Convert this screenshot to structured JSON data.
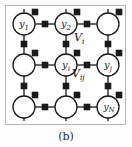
{
  "figure": {
    "caption": "(b)",
    "frame": {
      "color": "#b9b7b5"
    },
    "colors": {
      "stroke": "#1a1a1a",
      "factor_fill": "#1a1a1a",
      "node_fill": "#ffffff",
      "background": "#ffffff"
    },
    "diagram_type": "factor-graph-grid",
    "grid": {
      "columns": 3,
      "rows": 3,
      "node_centers_x": [
        24,
        66,
        108
      ],
      "node_centers_y": [
        24,
        65,
        107
      ],
      "node_radius": 11,
      "factor_square_size": 5
    },
    "nodes": [
      {
        "id": "n00",
        "label": "y",
        "sub": "1",
        "has_label": true,
        "cx": 24,
        "cy": 24
      },
      {
        "id": "n01",
        "label": "y",
        "sub": "2",
        "has_label": true,
        "cx": 66,
        "cy": 24
      },
      {
        "id": "n02",
        "label": "",
        "sub": "",
        "has_label": false,
        "cx": 108,
        "cy": 24
      },
      {
        "id": "n10",
        "label": "",
        "sub": "",
        "has_label": false,
        "cx": 24,
        "cy": 65
      },
      {
        "id": "n11",
        "label": "y",
        "sub": "i",
        "has_label": true,
        "cx": 66,
        "cy": 65
      },
      {
        "id": "n12",
        "label": "y",
        "sub": "j",
        "has_label": true,
        "cx": 108,
        "cy": 65
      },
      {
        "id": "n20",
        "label": "",
        "sub": "",
        "has_label": false,
        "cx": 24,
        "cy": 107
      },
      {
        "id": "n21",
        "label": "",
        "sub": "",
        "has_label": false,
        "cx": 66,
        "cy": 107
      },
      {
        "id": "n22",
        "label": "y",
        "sub": "N",
        "has_label": true,
        "cx": 108,
        "cy": 107
      }
    ],
    "annotations": [
      {
        "id": "vi",
        "symbol": "V",
        "sub": "i",
        "x": 74,
        "y": 38
      },
      {
        "id": "vij",
        "symbol": "V",
        "sub": "ij",
        "x": 72,
        "y": 74
      }
    ]
  }
}
